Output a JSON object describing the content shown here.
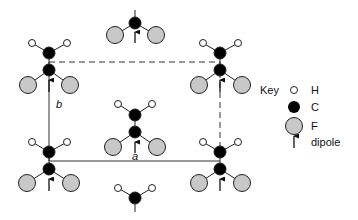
{
  "figure": {
    "type": "crystal-structure-projection",
    "axes": {
      "a_label": "a",
      "b_label": "b"
    },
    "cell": {
      "top_edge": "dashed",
      "right_edge": "dashed",
      "bottom_edge": "solid",
      "left_edge": "solid"
    },
    "molecules": [
      {
        "id": "top-left",
        "position": "cell corner top-left",
        "dipole": "up"
      },
      {
        "id": "top-center",
        "position": "above cell, partially cropped",
        "dipole": "up"
      },
      {
        "id": "top-right",
        "position": "cell corner top-right",
        "dipole": "up"
      },
      {
        "id": "center",
        "position": "cell center",
        "dipole": "up"
      },
      {
        "id": "bottom-left",
        "position": "cell corner bottom-left",
        "dipole": "up"
      },
      {
        "id": "bottom-center",
        "position": "below cell, partially cropped",
        "dipole": "up"
      },
      {
        "id": "bottom-right",
        "position": "cell corner bottom-right",
        "dipole": "up"
      }
    ]
  },
  "key": {
    "title": "Key",
    "items": [
      {
        "symbol": "hydrogen-atom",
        "label": "H"
      },
      {
        "symbol": "carbon-atom",
        "label": "C"
      },
      {
        "symbol": "fluorine-atom",
        "label": "F"
      },
      {
        "symbol": "dipole-arrow",
        "label": "dipole"
      }
    ]
  },
  "colors": {
    "hydrogen_fill": "#ffffff",
    "carbon_fill": "#000000",
    "fluorine_fill": "#c8c8c8",
    "stroke": "#222222",
    "background": "#ffffff"
  }
}
